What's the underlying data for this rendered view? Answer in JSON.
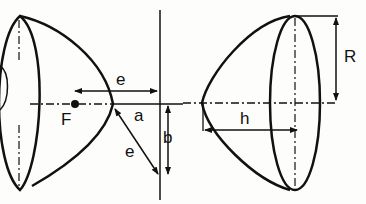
{
  "diagram": {
    "colors": {
      "stroke": "#111111",
      "background": "#fdfdfb"
    },
    "left_figure": {
      "labels": {
        "focus": "F",
        "focal_distance_top": "e",
        "vertex_to_directrix": "a",
        "directrix_offset": "b",
        "focal_distance_diagonal": "e"
      }
    },
    "right_figure": {
      "labels": {
        "radius": "R",
        "height": "h"
      }
    }
  }
}
